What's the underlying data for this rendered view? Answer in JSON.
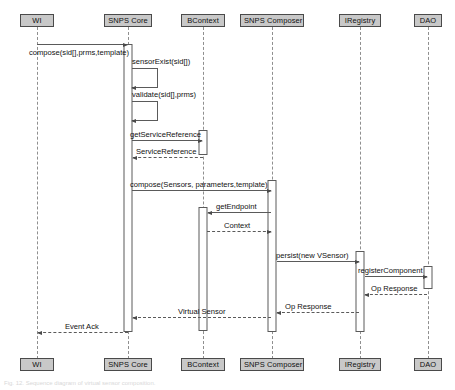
{
  "diagram": {
    "type": "uml-sequence-diagram",
    "title": "",
    "caption": "Fig. 12. Sequence diagram of virtual sensor composition."
  },
  "lifelines": [
    {
      "id": "wi",
      "label": "WI",
      "x": 37
    },
    {
      "id": "core",
      "label": "SNPS Core",
      "x": 128
    },
    {
      "id": "bcontext",
      "label": "BContext",
      "x": 203
    },
    {
      "id": "composer",
      "label": "SNPS Composer",
      "x": 272
    },
    {
      "id": "iregistry",
      "label": "IRegistry",
      "x": 360
    },
    {
      "id": "dao",
      "label": "DAO",
      "x": 428
    }
  ],
  "messages": [
    {
      "id": "m1",
      "label": "compose(sid[],prms,template)",
      "from": "wi",
      "to": "core",
      "kind": "call",
      "direction": "right"
    },
    {
      "id": "m2",
      "label": "sensorExist(sid[])",
      "from": "core",
      "to": "core",
      "kind": "self",
      "direction": "self"
    },
    {
      "id": "m3",
      "label": "validate(sid[],prms)",
      "from": "core",
      "to": "core",
      "kind": "self",
      "direction": "self"
    },
    {
      "id": "m4",
      "label": "getServiceReference",
      "from": "core",
      "to": "bcontext",
      "kind": "call",
      "direction": "right"
    },
    {
      "id": "m5",
      "label": "ServiceReference",
      "from": "bcontext",
      "to": "core",
      "kind": "return",
      "direction": "left"
    },
    {
      "id": "m6",
      "label": "compose(Sensors, parameters,template)",
      "from": "core",
      "to": "composer",
      "kind": "call",
      "direction": "right"
    },
    {
      "id": "m7",
      "label": "getEndpoint",
      "from": "composer",
      "to": "bcontext",
      "kind": "call",
      "direction": "left"
    },
    {
      "id": "m8",
      "label": "Context",
      "from": "bcontext",
      "to": "composer",
      "kind": "return",
      "direction": "right"
    },
    {
      "id": "m9",
      "label": "persist(new VSensor)",
      "from": "composer",
      "to": "iregistry",
      "kind": "call",
      "direction": "right"
    },
    {
      "id": "m10",
      "label": "registerComponent",
      "from": "iregistry",
      "to": "dao",
      "kind": "call",
      "direction": "right"
    },
    {
      "id": "m11",
      "label": "Op Response",
      "from": "dao",
      "to": "iregistry",
      "kind": "return",
      "direction": "left"
    },
    {
      "id": "m12",
      "label": "Op Response",
      "from": "iregistry",
      "to": "composer",
      "kind": "return",
      "direction": "left"
    },
    {
      "id": "m13",
      "label": "Virtual Sensor",
      "from": "composer",
      "to": "core",
      "kind": "return",
      "direction": "left"
    },
    {
      "id": "m14",
      "label": "Event Ack",
      "from": "core",
      "to": "wi",
      "kind": "return",
      "direction": "left"
    }
  ],
  "colors": {
    "actor_fill": "#c8c8c8",
    "actor_border": "#4a4a4a",
    "line": "#5a5a5a",
    "lifeline": "#8f8f8f",
    "text": "#111111",
    "background": "#ffffff"
  }
}
